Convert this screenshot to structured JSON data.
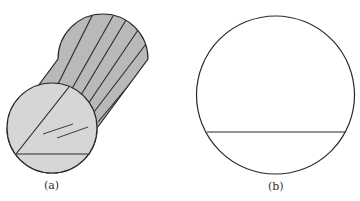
{
  "figure": {
    "panels": [
      {
        "id": "a",
        "label": "(a)",
        "description": "cylinder with striped curved surface and sectioned end face"
      },
      {
        "id": "b",
        "label": "(b)",
        "description": "circle with horizontal chord"
      }
    ]
  },
  "colors": {
    "stroke": "#2a2a2a",
    "body_fill": "#b9b9b9",
    "face_fill": "#d6d6d6",
    "background": "#ffffff"
  }
}
